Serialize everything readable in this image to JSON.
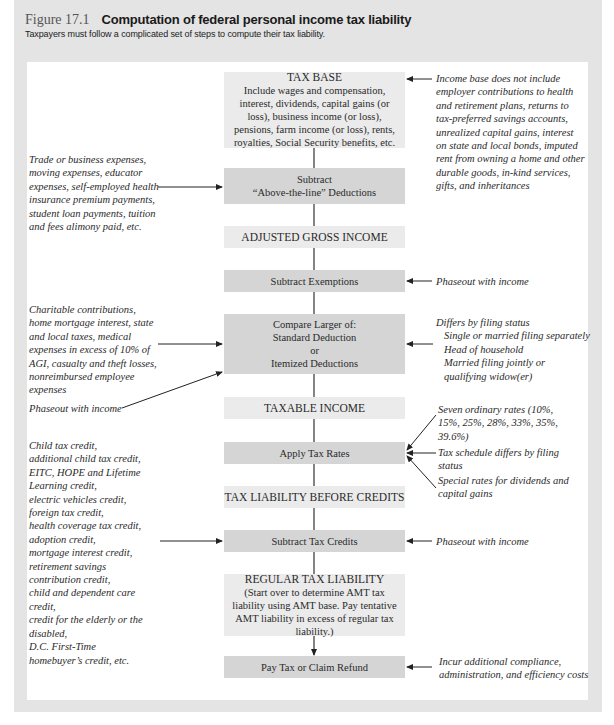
{
  "figure": {
    "label": "Figure 17.1",
    "title": "Computation of federal personal income tax liability",
    "subtitle": "Taxpayers must follow a complicated set of steps to compute their tax liability."
  },
  "steps": [
    {
      "id": "tax-base",
      "title": "TAX BASE",
      "text": "Include wages and compensation, interest, dividends, capital gains (or loss), business income (or loss), pensions, farm income (or loss), rents, royalties, Social Security benefits, etc."
    },
    {
      "id": "above-the-line",
      "lines": [
        "Subtract",
        "“Above-the-line” Deductions"
      ]
    },
    {
      "id": "agi",
      "title": "ADJUSTED GROSS INCOME"
    },
    {
      "id": "exemptions",
      "lines": [
        "Subtract Exemptions"
      ]
    },
    {
      "id": "compare",
      "lines": [
        "Compare Larger of:",
        "Standard Deduction",
        "or",
        "Itemized Deductions"
      ]
    },
    {
      "id": "taxable-income",
      "title": "TAXABLE INCOME"
    },
    {
      "id": "apply-rates",
      "lines": [
        "Apply Tax Rates"
      ]
    },
    {
      "id": "liability-before-credits",
      "title": "TAX LIABILITY BEFORE CREDITS"
    },
    {
      "id": "tax-credits",
      "lines": [
        "Subtract Tax Credits"
      ]
    },
    {
      "id": "regular-liability",
      "title": "REGULAR TAX LIABILITY",
      "text": "(Start over to determine AMT tax liability using AMT base. Pay tentative AMT liability in excess of regular tax liability.)"
    },
    {
      "id": "pay-tax",
      "lines": [
        "Pay Tax or Claim Refund"
      ]
    }
  ],
  "notes": {
    "income_base": "Income base does not include employer contributions to health and retirement plans, returns to tax-preferred savings accounts, unrealized capital gains, interest on state and local bonds, imputed rent from owning a home and other durable goods, in-kind services, gifts, and inheritances",
    "above_line": "Trade or business expenses, moving expenses, educator expenses, self-employed health insurance premium payments, student loan payments, tuition and fees alimony paid, etc.",
    "exemptions_phaseout": "Phaseout with income",
    "itemized": "Charitable contributions, home mortgage interest, state and local taxes, medical expenses in excess of 10% of AGI, casualty and theft losses, nonreimbursed employee expenses",
    "itemized_phaseout": "Phaseout with income",
    "filing_status": {
      "heading": "Differs by filing status",
      "items": [
        "Single or married filing separately",
        "Head of household",
        "Married filing jointly or",
        "qualifying widow(er)"
      ]
    },
    "rates_seven": "Seven ordinary rates (10%, 15%, 25%, 28%, 33%, 35%, 39.6%)",
    "rates_schedule": "Tax schedule differs by filing status",
    "rates_special": "Special rates for dividends and capital gains",
    "credits_list": [
      "Child tax credit,",
      "additional child tax credit,",
      "EITC, HOPE and Lifetime",
      "Learning credit,",
      "electric vehicles credit,",
      "foreign tax credit,",
      "health coverage tax credit,",
      "adoption credit,",
      "mortgage interest credit,",
      "retirement savings",
      "contribution credit,",
      "child and dependent care",
      "credit,",
      "credit for the elderly or the",
      "disabled,",
      "D.C. First-Time",
      "homebuyer’s credit, etc."
    ],
    "credits_phaseout": "Phaseout with income",
    "pay_costs": "Incur additional compliance, administration, and efficiency costs"
  }
}
